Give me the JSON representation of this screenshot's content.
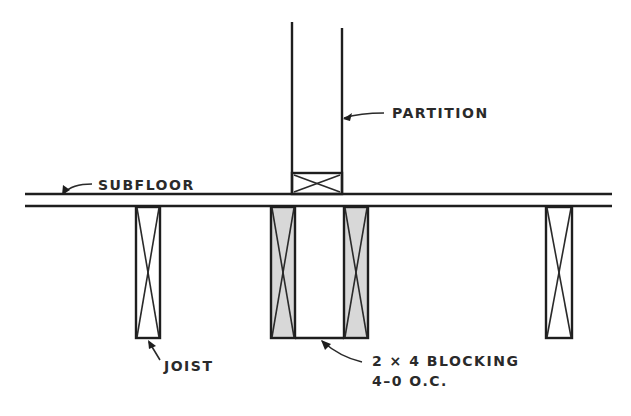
{
  "diagram": {
    "type": "framing-section",
    "labels": {
      "partition": "PARTITION",
      "subfloor": "SUBFLOOR",
      "joist": "JOIST",
      "blocking_line1": "2 × 4 BLOCKING",
      "blocking_line2": "4–0 O.C."
    },
    "colors": {
      "line": "#1e1e1e",
      "blocking_fill": "#d8d8d8",
      "background": "#ffffff"
    }
  }
}
